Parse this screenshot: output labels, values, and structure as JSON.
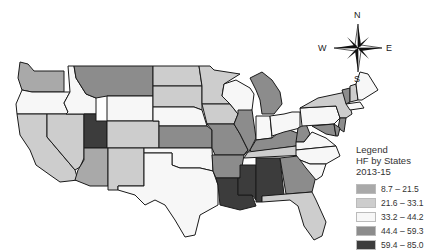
{
  "legend": {
    "title_line1": "Legend",
    "title_line2": "HF by States",
    "title_line3": "2013-15",
    "classes": [
      {
        "label": "8.7 – 21.5",
        "color": "#a9a9a9"
      },
      {
        "label": "21.6 – 33.1",
        "color": "#cdcdcd"
      },
      {
        "label": "33.2 – 44.2",
        "color": "#f7f7f7"
      },
      {
        "label": "44.4 – 59.3",
        "color": "#8c8c8c"
      },
      {
        "label": "59.4 – 85.0",
        "color": "#3c3c3c"
      }
    ]
  },
  "compass": {
    "n": "N",
    "s": "S",
    "e": "E",
    "w": "W"
  },
  "states": {
    "WA": 1,
    "OR": 3,
    "CA": 2,
    "NV": 2,
    "ID": 3,
    "MT": 4,
    "WY": 3,
    "UT": 5,
    "CO": 2,
    "AZ": 1,
    "NM": 2,
    "ND": 2,
    "SD": 2,
    "NE": 3,
    "KS": 4,
    "OK": 3,
    "TX": 3,
    "MN": 2,
    "IA": 2,
    "MO": 4,
    "AR": 4,
    "LA": 5,
    "WI": 3,
    "IL": 4,
    "MS": 5,
    "MI": 4,
    "IN": 3,
    "KY": 4,
    "TN": 2,
    "AL": 5,
    "GA": 4,
    "FL": 2,
    "OH": 3,
    "WV": 4,
    "VA": 3,
    "NC": 3,
    "SC": 3,
    "PA": 3,
    "NY": 2,
    "VT": 4,
    "NH": 2,
    "ME": 3,
    "MA": 3,
    "MD": 4,
    "DE": 4,
    "NJ": 4
  }
}
